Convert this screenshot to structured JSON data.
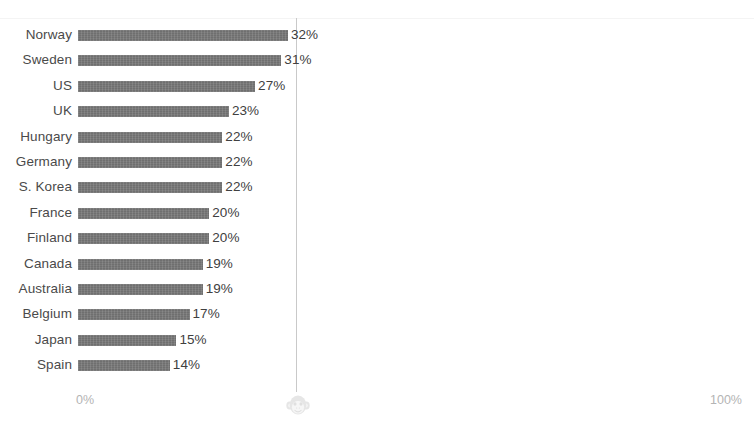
{
  "chart_data": {
    "type": "bar",
    "orientation": "horizontal",
    "title": "",
    "subtitle": "",
    "xlabel": "",
    "ylabel": "",
    "xlim": [
      0,
      100
    ],
    "grid": true,
    "gridlines_at": [
      50
    ],
    "legend": null,
    "value_suffix": "%",
    "categories": [
      "Norway",
      "Sweden",
      "US",
      "UK",
      "Hungary",
      "Germany",
      "S. Korea",
      "France",
      "Finland",
      "Canada",
      "Australia",
      "Belgium",
      "Japan",
      "Spain"
    ],
    "values": [
      32,
      31,
      27,
      23,
      22,
      22,
      22,
      20,
      20,
      19,
      19,
      17,
      15,
      14
    ],
    "value_labels": [
      "32%",
      "31%",
      "27%",
      "23%",
      "22%",
      "22%",
      "22%",
      "20%",
      "20%",
      "19%",
      "19%",
      "17%",
      "15%",
      "14%"
    ],
    "axis_ticks": [
      {
        "value": 0,
        "label": "0%"
      },
      {
        "value": 100,
        "label": "100%"
      }
    ],
    "colors": {
      "bar": "#6f6f6f",
      "background": "#ffffff",
      "category_label": "#4a4a4a",
      "value_label": "#404040",
      "axis_tick_label": "#b4b4b4",
      "gridline": "#c9c9c9",
      "watermark": "#e6e6e6"
    }
  },
  "watermark": {
    "icon": "monkey-face-icon",
    "position_pct": 50,
    "color": "#e6e6e6"
  }
}
